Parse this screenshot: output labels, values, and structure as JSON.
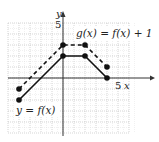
{
  "chart_data": {
    "type": "line",
    "title": "",
    "xlabel": "x",
    "ylabel": "y",
    "xlim": [
      -5,
      6
    ],
    "ylim": [
      -5,
      5
    ],
    "grid": true,
    "tick_labels": {
      "x": [
        "5"
      ],
      "y": [
        "5"
      ]
    },
    "series": [
      {
        "name": "y = f(x)",
        "style": "solid",
        "points": [
          [
            -4,
            -2
          ],
          [
            0,
            2
          ],
          [
            2,
            2
          ],
          [
            4,
            0
          ]
        ]
      },
      {
        "name": "g(x) = f(x) + 1",
        "style": "dashed",
        "points": [
          [
            -4,
            -1
          ],
          [
            0,
            3
          ],
          [
            2,
            3
          ],
          [
            4,
            1
          ]
        ]
      }
    ],
    "annotations": [
      {
        "text": "g(x) = f(x) + 1",
        "position": "upper right"
      },
      {
        "text": "y = f(x)",
        "position": "lower left"
      }
    ]
  },
  "labels": {
    "y_axis": "y",
    "x_axis": "x",
    "y_tick": "5",
    "x_tick": "5",
    "g_label": "g(x) = f(x) + 1",
    "f_label": "y = f(x)"
  }
}
